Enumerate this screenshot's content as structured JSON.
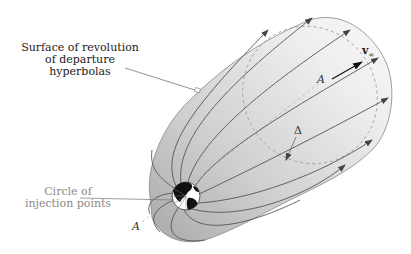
{
  "figure": {
    "colors": {
      "surface_light": "#f2f2f2",
      "surface_dark": "#c4c4c4",
      "trajectory": "#555555",
      "dashed": "#999999",
      "earth_land": "#111111",
      "earth_ocean": "#ffffff",
      "label_dark": "#222222",
      "label_gray": "#8a8a8a"
    }
  },
  "labels": {
    "surface": {
      "line1": "Surface of revolution",
      "line2": "of departure hyperbolas"
    },
    "injection": {
      "line1": "Circle of",
      "line2": "injection points"
    },
    "axis_point_top": "A",
    "axis_point_bottom": "A",
    "velocity": "v",
    "velocity_sub": "∞",
    "aiming_radius": "Δ"
  },
  "icons": {
    "earth": "earth-globe-icon",
    "velocity_arrow": "arrow-right-icon",
    "trajectory_arrow": "arrowhead-icon"
  }
}
